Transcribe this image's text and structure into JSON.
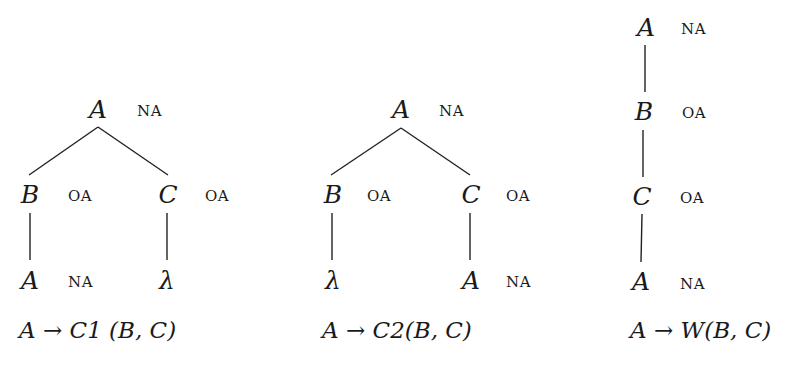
{
  "diagrams": [
    {
      "id": "c1",
      "nodes": [
        {
          "label": "A",
          "tag": "NA",
          "x": 98,
          "y": 109
        },
        {
          "label": "B",
          "tag": "OA",
          "x": 30,
          "y": 194
        },
        {
          "label": "C",
          "tag": "OA",
          "x": 168,
          "y": 194
        },
        {
          "label": "A",
          "tag": "NA",
          "x": 30,
          "y": 280
        },
        {
          "label": "λ",
          "tag": "",
          "x": 167,
          "y": 280
        }
      ],
      "caption": {
        "lhs": "A",
        "arrow": "→",
        "rhs": "C1 (B, C)"
      }
    },
    {
      "id": "c2",
      "nodes": [
        {
          "label": "A",
          "tag": "NA",
          "x": 401,
          "y": 109
        },
        {
          "label": "B",
          "tag": "OA",
          "x": 333,
          "y": 194
        },
        {
          "label": "C",
          "tag": "OA",
          "x": 471,
          "y": 194
        },
        {
          "label": "λ",
          "tag": "",
          "x": 333,
          "y": 280
        },
        {
          "label": "A",
          "tag": "NA",
          "x": 471,
          "y": 280
        }
      ],
      "caption": {
        "lhs": "A",
        "arrow": "→",
        "rhs": "C2(B, C)"
      }
    },
    {
      "id": "w",
      "nodes": [
        {
          "label": "A",
          "tag": "NA",
          "x": 646,
          "y": 27
        },
        {
          "label": "B",
          "tag": "OA",
          "x": 644,
          "y": 111
        },
        {
          "label": "C",
          "tag": "OA",
          "x": 642,
          "y": 196
        },
        {
          "label": "A",
          "tag": "NA",
          "x": 641,
          "y": 281
        }
      ],
      "caption": {
        "lhs": "A",
        "arrow": "→",
        "rhs": "W(B, C)"
      }
    }
  ]
}
